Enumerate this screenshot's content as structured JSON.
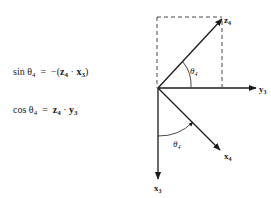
{
  "equations": [
    {
      "lhs_fn": "sin",
      "lhs_angle": "θ",
      "lhs_angle_sub": "4",
      "op": "=",
      "rhs_prefix": "−(",
      "rhs_v1": "z",
      "rhs_v1_sub": "4",
      "dot": "·",
      "rhs_v2": "x",
      "rhs_v2_sub": "3",
      "rhs_suffix": ")"
    },
    {
      "lhs_fn": "cos",
      "lhs_angle": "θ",
      "lhs_angle_sub": "4",
      "op": "=",
      "rhs_prefix": "",
      "rhs_v1": "z",
      "rhs_v1_sub": "4",
      "dot": "·",
      "rhs_v2": "y",
      "rhs_v2_sub": "3",
      "rhs_suffix": ""
    }
  ],
  "diagram": {
    "axes": {
      "z4": {
        "name": "z",
        "sub": "4"
      },
      "y3": {
        "name": "y",
        "sub": "3"
      },
      "x4": {
        "name": "x",
        "sub": "4"
      },
      "x3": {
        "name": "x",
        "sub": "3"
      }
    },
    "angles": [
      {
        "name": "θ",
        "sub": "4",
        "between": "y3-z4"
      },
      {
        "name": "θ",
        "sub": "4",
        "between": "x3-x4"
      }
    ],
    "colors": {
      "ink": "#1a1a1a",
      "background": "#ffffff"
    }
  }
}
